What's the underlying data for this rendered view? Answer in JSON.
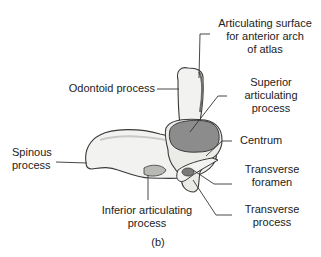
{
  "figure": {
    "caption": "(b)"
  },
  "labels": {
    "articulating_surface": [
      "Articulating surface",
      "for anterior arch",
      "of atlas"
    ],
    "odontoid_process": "Odontoid process",
    "superior_articulating_process": [
      "Superior",
      "articulating",
      "process"
    ],
    "centrum": "Centrum",
    "spinous_process": [
      "Spinous",
      "process"
    ],
    "transverse_foramen": [
      "Transverse",
      "foramen"
    ],
    "inferior_articulating_process": [
      "Inferior articulating",
      "process"
    ],
    "transverse_process": [
      "Transverse",
      "process"
    ]
  },
  "colors": {
    "text": "#222222",
    "leader_line": "#333333",
    "bone_fill": "#f2f2f0",
    "bone_shade": "#c9c9c6",
    "bone_outline": "#3a3a3a",
    "articular_facet": "#8c8c8c"
  }
}
